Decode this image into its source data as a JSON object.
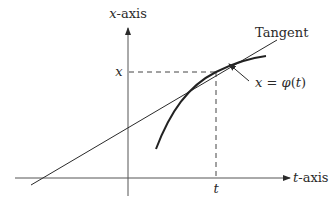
{
  "diagram": {
    "colors": {
      "background": "#ffffff",
      "ink": "#2a2a2a",
      "axis": "#555555"
    },
    "labels": {
      "vertical_axis_var": "x",
      "vertical_axis_suffix": "-axis",
      "horizontal_axis_var": "t",
      "horizontal_axis_suffix": "-axis",
      "x_tick": "x",
      "t_tick": "t",
      "tangent": "Tangent",
      "curve_lhs": "x",
      "curve_eq": " = ",
      "curve_fn": "φ",
      "curve_arg_open": "(",
      "curve_arg": "t",
      "curve_arg_close": ")"
    }
  }
}
